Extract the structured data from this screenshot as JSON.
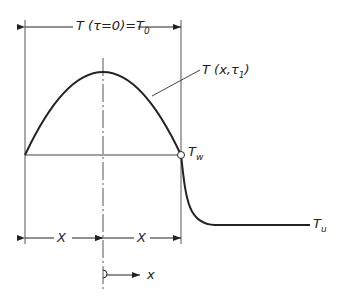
{
  "diagram": {
    "top_label": {
      "main": "T (τ=0)=T",
      "sub": "0"
    },
    "curve_label": {
      "main": "T (x,τ",
      "sub": "1",
      "end": ")"
    },
    "wall_label": {
      "main": "T",
      "sub": "w"
    },
    "ambient_label": {
      "main": "T",
      "sub": "u"
    },
    "half_width_left": "X",
    "half_width_right": "X",
    "axis_label": "x",
    "colors": {
      "line": "#222222",
      "thin": "#555555"
    }
  }
}
